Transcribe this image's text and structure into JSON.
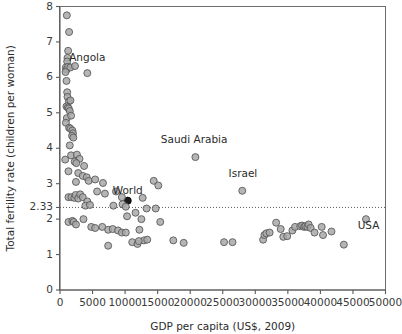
{
  "chart_data": {
    "type": "scatter",
    "title": "",
    "xlabel": "GDP per capita (US$, 2009)",
    "ylabel": "Total fertility rate (children per woman)",
    "xlim": [
      0,
      50000
    ],
    "ylim": [
      0,
      8
    ],
    "xticks": [
      0,
      5000,
      10000,
      15000,
      20000,
      25000,
      30000,
      35000,
      40000,
      45000,
      50000
    ],
    "xtick_labels": [
      "0",
      "5000",
      "10000",
      "15000",
      "20000",
      "25000",
      "30000",
      "35000",
      "40000",
      "45000",
      "50000"
    ],
    "yticks": [
      0,
      1,
      2,
      2.33,
      3,
      4,
      5,
      6,
      7,
      8
    ],
    "ytick_labels": [
      "0",
      "1",
      "2",
      "2.33",
      "3",
      "4",
      "5",
      "6",
      "7",
      "8"
    ],
    "grid": false,
    "legend": null,
    "annotations": [
      {
        "text": "Angola",
        "x": 4200,
        "y": 6.45
      },
      {
        "text": "Saudi Arabia",
        "x": 20600,
        "y": 4.15
      },
      {
        "text": "Israel",
        "x": 28100,
        "y": 3.18
      },
      {
        "text": "World",
        "x": 10400,
        "y": 2.72
      },
      {
        "text": "USA",
        "x": 47400,
        "y": 1.72
      }
    ],
    "reference_lines": [
      {
        "orientation": "horizontal",
        "value": 2.33,
        "label": "2.33",
        "style": "dotted"
      }
    ],
    "series": [
      {
        "name": "World average",
        "marker": "filled-circle",
        "color": "#1a1a1a",
        "points": [
          [
            10400,
            2.52
          ]
        ]
      },
      {
        "name": "Countries",
        "marker": "open-circle",
        "color": "#a8a8a8",
        "points": [
          [
            1050,
            7.75
          ],
          [
            1400,
            7.28
          ],
          [
            1250,
            6.75
          ],
          [
            1150,
            6.55
          ],
          [
            1100,
            6.45
          ],
          [
            900,
            6.28
          ],
          [
            1000,
            6.22
          ],
          [
            1250,
            6.3
          ],
          [
            1600,
            6.28
          ],
          [
            2300,
            6.32
          ],
          [
            4200,
            6.12
          ],
          [
            850,
            6.15
          ],
          [
            1000,
            5.9
          ],
          [
            1100,
            5.58
          ],
          [
            1150,
            5.45
          ],
          [
            1350,
            5.32
          ],
          [
            1600,
            5.35
          ],
          [
            1000,
            5.18
          ],
          [
            1200,
            5.15
          ],
          [
            1350,
            5.12
          ],
          [
            1500,
            5.05
          ],
          [
            1050,
            4.85
          ],
          [
            1700,
            4.92
          ],
          [
            900,
            4.72
          ],
          [
            1400,
            4.58
          ],
          [
            1600,
            4.55
          ],
          [
            1900,
            4.5
          ],
          [
            2000,
            4.42
          ],
          [
            1850,
            4.35
          ],
          [
            2050,
            4.3
          ],
          [
            1500,
            4.08
          ],
          [
            800,
            3.68
          ],
          [
            1700,
            3.8
          ],
          [
            2600,
            3.82
          ],
          [
            3000,
            3.7
          ],
          [
            2250,
            3.62
          ],
          [
            2500,
            3.58
          ],
          [
            3700,
            3.5
          ],
          [
            20800,
            3.75
          ],
          [
            1300,
            3.35
          ],
          [
            2800,
            3.3
          ],
          [
            3500,
            3.22
          ],
          [
            4100,
            3.18
          ],
          [
            2450,
            3.05
          ],
          [
            4400,
            3.08
          ],
          [
            5400,
            3.12
          ],
          [
            6600,
            3.02
          ],
          [
            14400,
            3.08
          ],
          [
            15100,
            2.95
          ],
          [
            1300,
            2.62
          ],
          [
            1750,
            2.62
          ],
          [
            2200,
            2.6
          ],
          [
            2400,
            2.68
          ],
          [
            2800,
            2.58
          ],
          [
            3100,
            2.7
          ],
          [
            3500,
            2.62
          ],
          [
            4200,
            2.5
          ],
          [
            5700,
            2.78
          ],
          [
            6900,
            2.72
          ],
          [
            8600,
            2.78
          ],
          [
            9500,
            2.62
          ],
          [
            12700,
            2.6
          ],
          [
            28000,
            2.8
          ],
          [
            3900,
            2.38
          ],
          [
            4600,
            2.4
          ],
          [
            8200,
            2.38
          ],
          [
            9600,
            2.42
          ],
          [
            10100,
            2.35
          ],
          [
            13300,
            2.3
          ],
          [
            14700,
            2.3
          ],
          [
            1300,
            1.92
          ],
          [
            1900,
            1.95
          ],
          [
            2100,
            1.92
          ],
          [
            2450,
            1.85
          ],
          [
            3600,
            2.0
          ],
          [
            10300,
            2.08
          ],
          [
            11600,
            2.18
          ],
          [
            12500,
            2.0
          ],
          [
            15400,
            1.92
          ],
          [
            47000,
            2.0
          ],
          [
            4800,
            1.78
          ],
          [
            5400,
            1.75
          ],
          [
            6500,
            1.78
          ],
          [
            7400,
            1.7
          ],
          [
            8100,
            1.72
          ],
          [
            8900,
            1.68
          ],
          [
            9500,
            1.62
          ],
          [
            10100,
            1.62
          ],
          [
            12200,
            1.7
          ],
          [
            12900,
            1.4
          ],
          [
            13400,
            1.42
          ],
          [
            11100,
            1.35
          ],
          [
            11900,
            1.3
          ],
          [
            12100,
            1.38
          ],
          [
            7400,
            1.25
          ],
          [
            17400,
            1.4
          ],
          [
            19000,
            1.33
          ],
          [
            25200,
            1.35
          ],
          [
            26500,
            1.35
          ],
          [
            31200,
            1.42
          ],
          [
            31400,
            1.55
          ],
          [
            31700,
            1.6
          ],
          [
            32200,
            1.62
          ],
          [
            33200,
            1.9
          ],
          [
            33900,
            1.72
          ],
          [
            34300,
            1.5
          ],
          [
            34900,
            1.52
          ],
          [
            35700,
            1.68
          ],
          [
            36100,
            1.78
          ],
          [
            36900,
            1.8
          ],
          [
            37200,
            1.82
          ],
          [
            37500,
            1.78
          ],
          [
            37700,
            1.8
          ],
          [
            38000,
            1.78
          ],
          [
            38200,
            1.85
          ],
          [
            38500,
            1.75
          ],
          [
            39100,
            1.62
          ],
          [
            40200,
            1.78
          ],
          [
            40400,
            1.55
          ],
          [
            41700,
            1.65
          ],
          [
            43600,
            1.28
          ]
        ]
      }
    ]
  }
}
